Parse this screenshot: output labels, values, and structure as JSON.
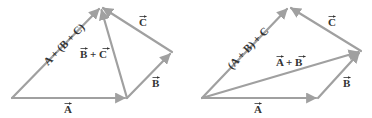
{
  "colors": {
    "vector": "#a0a0a0",
    "label": "#333333",
    "background": "#ffffff"
  },
  "diagrams": [
    {
      "id": "left",
      "title": "A + (B + C)",
      "points": {
        "origin": [
          12,
          98
        ],
        "a_tip": [
          127,
          98
        ],
        "b_tip": [
          172,
          52
        ],
        "top": [
          101,
          7
        ]
      },
      "labels": {
        "A": "A",
        "B": "B",
        "C": "C",
        "sum_bc": "B + C",
        "resultant": "A + (B + C)"
      }
    },
    {
      "id": "right",
      "title": "(A + B) + C",
      "points": {
        "origin": [
          202,
          98
        ],
        "a_tip": [
          318,
          98
        ],
        "b_tip": [
          361,
          51
        ],
        "top": [
          289,
          7
        ]
      },
      "labels": {
        "A": "A",
        "B": "B",
        "C": "C",
        "sum_ab": "A + B",
        "resultant": "(A + B) + C"
      }
    }
  ]
}
